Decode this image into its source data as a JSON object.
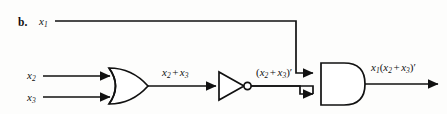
{
  "figure": {
    "part_label": "b.",
    "background_color": "#fdfdfc",
    "line_color": "#111111",
    "width": 447,
    "height": 114
  },
  "inputs": [
    {
      "name": "x1",
      "base": "x",
      "sub": "1",
      "y": 21
    },
    {
      "name": "x2",
      "base": "x",
      "sub": "2",
      "y": 76
    },
    {
      "name": "x3",
      "base": "x",
      "sub": "3",
      "y": 97
    }
  ],
  "gates": [
    {
      "id": "or-gate",
      "type": "OR",
      "inputs": [
        "x2",
        "x3"
      ],
      "output_label": "x2 + x3"
    },
    {
      "id": "not-gate",
      "type": "NOT",
      "inputs": [
        "x2 + x3"
      ],
      "output_label": "(x2 + x3)'"
    },
    {
      "id": "and-gate",
      "type": "AND",
      "inputs": [
        "x1",
        "(x2 + x3)'"
      ],
      "output_label": "x1(x2 + x3)'"
    }
  ],
  "labels": {
    "input_x1": {
      "base": "x",
      "sub": "1"
    },
    "input_x2": {
      "base": "x",
      "sub": "2"
    },
    "input_x3": {
      "base": "x",
      "sub": "3"
    },
    "or_output": {
      "text": "x2 + x3",
      "a_base": "x",
      "a_sub": "2",
      "operator": "+",
      "b_base": "x",
      "b_sub": "3"
    },
    "not_output": {
      "text": "(x2 + x3)'",
      "open": "(",
      "a_base": "x",
      "a_sub": "2",
      "operator": "+",
      "b_base": "x",
      "b_sub": "3",
      "close": ")",
      "prime": "′"
    },
    "and_output": {
      "text": "x1(x2 + x3)'",
      "lead_base": "x",
      "lead_sub": "1",
      "open": "(",
      "a_base": "x",
      "a_sub": "2",
      "operator": "+",
      "b_base": "x",
      "b_sub": "3",
      "close": ")",
      "prime": "′"
    }
  }
}
